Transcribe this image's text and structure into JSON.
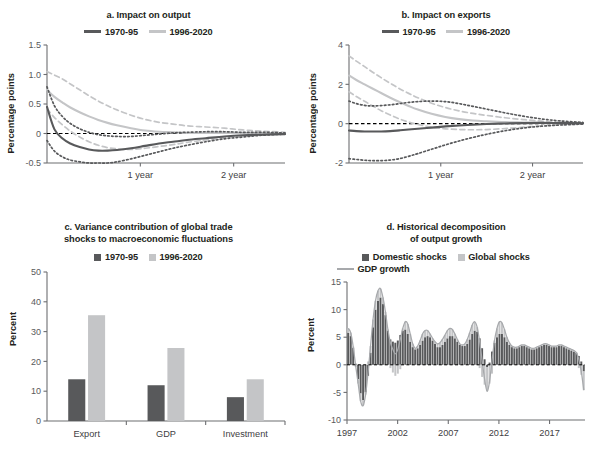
{
  "figure": {
    "colors": {
      "dark": "#58595b",
      "light": "#c4c5c7",
      "axis": "#6d6e71",
      "text": "#231f20",
      "tick": "#58595b",
      "zero_line": "#000000"
    }
  },
  "panels": {
    "a": {
      "title": "a. Impact on output",
      "legend": [
        {
          "label": "1970-95",
          "marker": "line",
          "color": "#58595b"
        },
        {
          "label": "1996-2020",
          "marker": "line",
          "color": "#c4c5c7"
        }
      ],
      "ylabel": "Percentage points",
      "yticks": [
        "1.5",
        "1.0",
        "0.5",
        "0",
        "-0.5"
      ],
      "xticks": [
        "1 year",
        "2 year"
      ]
    },
    "b": {
      "title": "b. Impact on exports",
      "legend": [
        {
          "label": "1970-95",
          "marker": "line",
          "color": "#58595b"
        },
        {
          "label": "1996-2020",
          "marker": "line",
          "color": "#c4c5c7"
        }
      ],
      "ylabel": "Percentage points",
      "yticks": [
        "4",
        "2",
        "0",
        "-2"
      ],
      "xticks": [
        "1 year",
        "2 year"
      ]
    },
    "c": {
      "title_line1": "c. Variance contribution of global trade",
      "title_line2": "shocks to macroeconomic fluctuations",
      "legend": [
        {
          "label": "1970-95",
          "marker": "swatch",
          "color": "#58595b"
        },
        {
          "label": "1996-2020",
          "marker": "swatch",
          "color": "#c4c5c7"
        }
      ],
      "ylabel": "Percent",
      "yticks": [
        "50",
        "40",
        "30",
        "20",
        "10",
        "0"
      ],
      "xticks": [
        "Export",
        "GDP",
        "Investment"
      ]
    },
    "d": {
      "title_line1": "d. Historical decomposition",
      "title_line2": "of output growth",
      "legend": [
        {
          "label": "Domestic shocks",
          "marker": "swatch",
          "color": "#58595b"
        },
        {
          "label": "Global shocks",
          "marker": "swatch",
          "color": "#c4c5c7"
        },
        {
          "label": "GDP growth",
          "marker": "line",
          "color": "#a7a9ac"
        }
      ],
      "ylabel": "Percent",
      "yticks": [
        "15",
        "10",
        "5",
        "0",
        "-5",
        "-10"
      ],
      "xticks": [
        "1997",
        "2002",
        "2007",
        "2012",
        "2017"
      ]
    }
  },
  "chart_data": [
    {
      "id": "a",
      "type": "line",
      "title": "a. Impact on output",
      "xlabel": "",
      "ylabel": "Percentage points",
      "ylim": [
        -0.5,
        1.5
      ],
      "xlim": [
        0,
        2.55
      ],
      "yticks": [
        1.5,
        1.0,
        0.5,
        0,
        -0.5
      ],
      "xtick_positions": [
        1,
        2
      ],
      "xtick_labels": [
        "1 year",
        "2 year"
      ],
      "grid": false,
      "legend_position": "top",
      "x": [
        0,
        0.08,
        0.17,
        0.25,
        0.35,
        0.45,
        0.55,
        0.65,
        0.75,
        0.9,
        1.05,
        1.2,
        1.35,
        1.5,
        1.7,
        1.9,
        2.1,
        2.3,
        2.55
      ],
      "series": [
        {
          "name": "1970-95",
          "style": "solid",
          "color": "#58595b",
          "values": [
            0.45,
            0.07,
            -0.09,
            -0.17,
            -0.23,
            -0.27,
            -0.29,
            -0.29,
            -0.28,
            -0.25,
            -0.21,
            -0.17,
            -0.14,
            -0.11,
            -0.08,
            -0.05,
            -0.03,
            -0.02,
            -0.01
          ]
        },
        {
          "name": "1970-95 upper",
          "style": "dotted",
          "color": "#58595b",
          "values": [
            0.79,
            0.47,
            0.28,
            0.17,
            0.08,
            0.02,
            -0.02,
            -0.04,
            -0.05,
            -0.05,
            -0.03,
            -0.01,
            0.01,
            0.02,
            0.03,
            0.03,
            0.02,
            0.02,
            0.01
          ]
        },
        {
          "name": "1970-95 lower",
          "style": "dotted",
          "color": "#58595b",
          "values": [
            -0.12,
            -0.3,
            -0.4,
            -0.45,
            -0.48,
            -0.5,
            -0.5,
            -0.5,
            -0.48,
            -0.43,
            -0.37,
            -0.31,
            -0.25,
            -0.2,
            -0.14,
            -0.09,
            -0.06,
            -0.03,
            -0.01
          ]
        },
        {
          "name": "1996-2020",
          "style": "solid",
          "color": "#c4c5c7",
          "values": [
            0.74,
            0.62,
            0.52,
            0.44,
            0.36,
            0.29,
            0.23,
            0.18,
            0.14,
            0.09,
            0.05,
            0.03,
            0.02,
            0.01,
            0.01,
            0.01,
            0.01,
            0.0,
            0.0
          ]
        },
        {
          "name": "1996-2020 upper",
          "style": "dashed",
          "color": "#c4c5c7",
          "values": [
            1.05,
            0.99,
            0.92,
            0.84,
            0.74,
            0.64,
            0.55,
            0.47,
            0.4,
            0.31,
            0.24,
            0.19,
            0.16,
            0.13,
            0.11,
            0.09,
            0.06,
            0.04,
            0.02
          ]
        },
        {
          "name": "1996-2020 lower",
          "style": "dashed",
          "color": "#c4c5c7",
          "values": [
            0.42,
            0.27,
            0.14,
            0.04,
            -0.06,
            -0.14,
            -0.2,
            -0.24,
            -0.26,
            -0.27,
            -0.25,
            -0.22,
            -0.19,
            -0.15,
            -0.11,
            -0.07,
            -0.04,
            -0.02,
            -0.01
          ]
        }
      ]
    },
    {
      "id": "b",
      "type": "line",
      "title": "b. Impact on exports",
      "xlabel": "",
      "ylabel": "Percentage points",
      "ylim": [
        -2,
        4
      ],
      "xlim": [
        0,
        2.55
      ],
      "yticks": [
        4,
        2,
        0,
        -2
      ],
      "xtick_positions": [
        1,
        2
      ],
      "xtick_labels": [
        "1 year",
        "2 year"
      ],
      "grid": false,
      "legend_position": "top",
      "x": [
        0,
        0.08,
        0.17,
        0.25,
        0.35,
        0.45,
        0.55,
        0.65,
        0.75,
        0.9,
        1.05,
        1.2,
        1.35,
        1.5,
        1.7,
        1.9,
        2.1,
        2.3,
        2.55
      ],
      "series": [
        {
          "name": "1970-95",
          "style": "solid",
          "color": "#58595b",
          "values": [
            -0.35,
            -0.38,
            -0.4,
            -0.4,
            -0.4,
            -0.38,
            -0.34,
            -0.3,
            -0.26,
            -0.2,
            -0.14,
            -0.09,
            -0.05,
            -0.02,
            0.01,
            0.03,
            0.04,
            0.03,
            0.02
          ]
        },
        {
          "name": "1970-95 upper",
          "style": "dotted",
          "color": "#58595b",
          "values": [
            1.15,
            1.02,
            0.93,
            0.9,
            0.92,
            0.96,
            1.02,
            1.08,
            1.12,
            1.15,
            1.12,
            1.02,
            0.88,
            0.74,
            0.55,
            0.38,
            0.24,
            0.14,
            0.06
          ]
        },
        {
          "name": "1970-95 lower",
          "style": "dotted",
          "color": "#58595b",
          "values": [
            -1.78,
            -1.82,
            -1.86,
            -1.88,
            -1.88,
            -1.85,
            -1.78,
            -1.66,
            -1.52,
            -1.3,
            -1.08,
            -0.88,
            -0.7,
            -0.54,
            -0.36,
            -0.22,
            -0.13,
            -0.07,
            -0.02
          ]
        },
        {
          "name": "1996-2020",
          "style": "solid",
          "color": "#c4c5c7",
          "values": [
            2.45,
            2.22,
            2.0,
            1.8,
            1.56,
            1.32,
            1.1,
            0.9,
            0.72,
            0.5,
            0.34,
            0.23,
            0.16,
            0.12,
            0.08,
            0.06,
            0.04,
            0.02,
            0.01
          ]
        },
        {
          "name": "1996-2020 upper",
          "style": "dashed",
          "color": "#c4c5c7",
          "values": [
            3.45,
            3.18,
            2.9,
            2.64,
            2.34,
            2.05,
            1.78,
            1.54,
            1.32,
            1.04,
            0.82,
            0.65,
            0.52,
            0.42,
            0.3,
            0.21,
            0.13,
            0.07,
            0.03
          ]
        },
        {
          "name": "1996-2020 lower",
          "style": "dashed",
          "color": "#c4c5c7",
          "values": [
            1.62,
            1.38,
            1.14,
            0.92,
            0.66,
            0.44,
            0.24,
            0.08,
            -0.04,
            -0.18,
            -0.26,
            -0.3,
            -0.31,
            -0.3,
            -0.25,
            -0.18,
            -0.11,
            -0.06,
            -0.02
          ]
        }
      ]
    },
    {
      "id": "c",
      "type": "bar",
      "title": "c. Variance contribution of global trade shocks to macroeconomic fluctuations",
      "xlabel": "",
      "ylabel": "Percent",
      "ylim": [
        0,
        50
      ],
      "yticks": [
        0,
        10,
        20,
        30,
        40,
        50
      ],
      "categories": [
        "Export",
        "GDP",
        "Investment"
      ],
      "grid": false,
      "legend_position": "top",
      "series": [
        {
          "name": "1970-95",
          "color": "#58595b",
          "values": [
            14,
            12,
            8
          ]
        },
        {
          "name": "1996-2020",
          "color": "#c4c5c7",
          "values": [
            35.5,
            24.5,
            14
          ]
        }
      ]
    },
    {
      "id": "d",
      "type": "bar",
      "title": "d. Historical decomposition of output growth",
      "xlabel": "",
      "ylabel": "Percent",
      "ylim": [
        -10,
        15
      ],
      "yticks": [
        -10,
        -5,
        0,
        5,
        10,
        15
      ],
      "xtick_labels": [
        "1997",
        "2002",
        "2007",
        "2012",
        "2017"
      ],
      "xtick_years": [
        1997,
        2002,
        2007,
        2012,
        2017
      ],
      "x_start": 1997,
      "x_end": 2020.5,
      "grid": false,
      "legend_position": "top",
      "note": "stacked quarterly bars; gray line overlay is GDP growth",
      "series": [
        {
          "name": "Domestic shocks",
          "color": "#58595b",
          "values": [
            5.8,
            5.2,
            3.1,
            0.2,
            -2.6,
            -5.2,
            -6.4,
            -5.0,
            -2.0,
            2.2,
            6.8,
            10.0,
            11.6,
            12.2,
            11.0,
            9.0,
            6.2,
            4.6,
            4.2,
            4.0,
            4.4,
            5.4,
            6.2,
            6.4,
            5.6,
            4.2,
            3.2,
            2.8,
            3.0,
            3.6,
            4.4,
            5.0,
            5.2,
            5.0,
            4.4,
            3.8,
            3.2,
            3.2,
            3.6,
            4.2,
            4.8,
            5.2,
            5.2,
            4.8,
            4.2,
            3.6,
            3.4,
            3.4,
            3.8,
            4.6,
            5.6,
            6.2,
            6.0,
            4.8,
            3.0,
            1.0,
            -0.4,
            0.4,
            2.4,
            4.0,
            5.0,
            5.6,
            5.6,
            5.0,
            4.2,
            3.6,
            3.2,
            3.0,
            3.0,
            3.2,
            3.4,
            3.4,
            3.2,
            3.0,
            2.8,
            2.8,
            3.0,
            3.2,
            3.4,
            3.6,
            3.6,
            3.4,
            3.2,
            3.2,
            3.2,
            3.4,
            3.4,
            3.2,
            3.0,
            2.8,
            2.6,
            2.4,
            2.2,
            1.6,
            0.6,
            -1.2
          ]
        },
        {
          "name": "Global shocks",
          "color": "#c4c5c7",
          "values": [
            0.8,
            0.6,
            0.2,
            -0.4,
            -0.8,
            -1.4,
            -1.0,
            -0.4,
            0.6,
            1.2,
            1.4,
            1.6,
            1.8,
            1.6,
            1.2,
            0.6,
            0.2,
            -0.6,
            -1.4,
            -2.0,
            -1.6,
            -0.8,
            0.4,
            1.4,
            1.8,
            1.4,
            0.6,
            0.2,
            0.4,
            0.8,
            1.2,
            1.2,
            1.0,
            0.6,
            0.4,
            0.4,
            0.6,
            0.8,
            1.0,
            1.2,
            1.4,
            1.4,
            1.2,
            0.8,
            0.4,
            0.2,
            0.2,
            0.4,
            0.8,
            1.2,
            1.6,
            1.6,
            0.8,
            -0.6,
            -2.2,
            -3.6,
            -4.4,
            -3.4,
            -1.6,
            0.4,
            1.6,
            2.2,
            2.0,
            1.4,
            0.8,
            0.4,
            0.2,
            0.2,
            0.2,
            0.2,
            0.2,
            0.2,
            0.2,
            0.2,
            0.2,
            0.2,
            0.2,
            0.2,
            0.2,
            0.2,
            0.2,
            0.2,
            0.2,
            0.2,
            0.2,
            0.2,
            0.2,
            0.2,
            0.2,
            0.2,
            0.2,
            0.2,
            0.0,
            -0.6,
            -1.8,
            -3.4
          ]
        },
        {
          "name": "GDP growth",
          "type": "line",
          "color": "#a7a9ac",
          "values": [
            6.6,
            5.8,
            3.3,
            -0.2,
            -3.4,
            -6.6,
            -7.4,
            -5.4,
            -1.4,
            3.4,
            8.2,
            11.6,
            13.4,
            13.8,
            12.2,
            9.6,
            6.4,
            4.0,
            2.8,
            2.0,
            2.8,
            4.6,
            6.6,
            7.8,
            7.4,
            5.6,
            3.8,
            3.0,
            3.4,
            4.4,
            5.6,
            6.2,
            6.2,
            5.6,
            4.8,
            4.2,
            3.8,
            4.0,
            4.6,
            5.4,
            6.2,
            6.6,
            6.4,
            5.6,
            4.6,
            3.8,
            3.6,
            3.8,
            4.6,
            5.8,
            7.2,
            7.8,
            6.8,
            4.2,
            0.8,
            -2.6,
            -4.8,
            -3.0,
            0.8,
            4.4,
            6.6,
            7.8,
            7.6,
            6.4,
            5.0,
            4.0,
            3.4,
            3.2,
            3.2,
            3.4,
            3.6,
            3.6,
            3.4,
            3.2,
            3.0,
            3.0,
            3.2,
            3.4,
            3.6,
            3.8,
            3.8,
            3.6,
            3.4,
            3.4,
            3.4,
            3.6,
            3.6,
            3.4,
            3.2,
            3.0,
            2.8,
            2.6,
            2.2,
            1.0,
            -1.2,
            -4.6
          ]
        }
      ]
    }
  ]
}
